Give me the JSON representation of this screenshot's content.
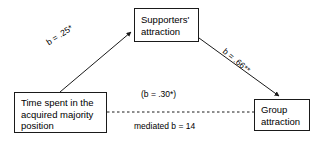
{
  "diagram": {
    "type": "mediation-path-diagram",
    "background_color": "#ffffff",
    "line_color": "#1a1a1a",
    "text_color": "#000000",
    "nodes": [
      {
        "id": "supporters",
        "lines": [
          "Supporters'",
          "attraction"
        ]
      },
      {
        "id": "time_spent",
        "lines": [
          "Time spent in the",
          "acquired majority",
          "position"
        ]
      },
      {
        "id": "group",
        "lines": [
          "Group",
          "attraction"
        ]
      }
    ],
    "edges": {
      "predictor_to_mediator": {
        "label": "b = .25*",
        "style": "solid",
        "arrowhead": true
      },
      "mediator_to_outcome": {
        "label": "b = .66**",
        "style": "solid",
        "arrowhead": true
      },
      "direct_path": {
        "label_above": "(b = .30*)",
        "label_below": "mediated b = 14",
        "style": "dashed",
        "arrowhead": false
      }
    }
  }
}
